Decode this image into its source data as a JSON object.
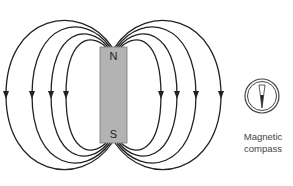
{
  "magnet": {
    "north_label": "N",
    "south_label": "S",
    "fill_color": "#b3b3b3"
  },
  "field_lines": {
    "count_per_side": 4,
    "arrow_direction": "down",
    "color": "#222222"
  },
  "compass": {
    "icon": "compass-icon",
    "caption_line1": "Magnetic",
    "caption_line2": "compass"
  }
}
